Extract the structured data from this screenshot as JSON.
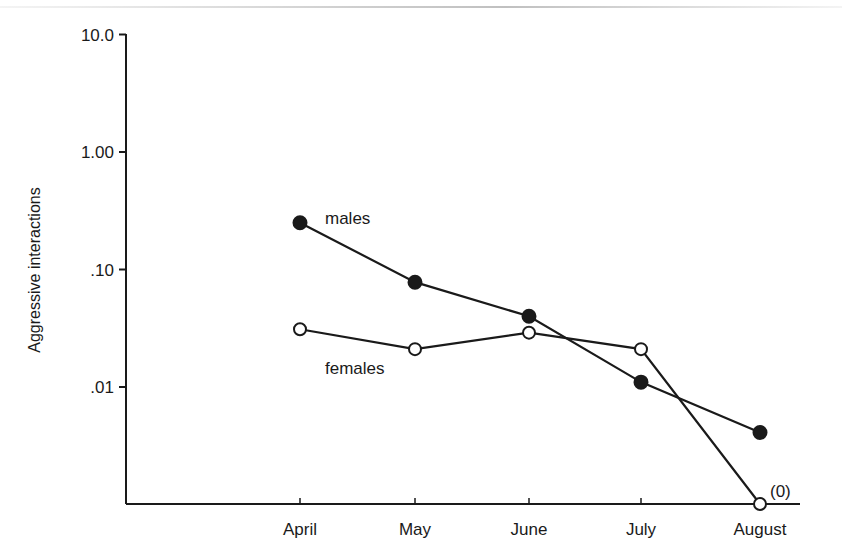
{
  "chart_data": {
    "type": "line",
    "title": "",
    "xlabel": "",
    "ylabel": "Aggressive interactions",
    "yscale": "log",
    "ylim": [
      0.001,
      10.0
    ],
    "y_ticks": [
      {
        "value": 10.0,
        "label": "10.0"
      },
      {
        "value": 1.0,
        "label": "1.00"
      },
      {
        "value": 0.1,
        "label": ".10"
      },
      {
        "value": 0.01,
        "label": ".01"
      }
    ],
    "categories": [
      "April",
      "May",
      "June",
      "July",
      "August"
    ],
    "series": [
      {
        "name": "males",
        "marker": "filled-circle",
        "values": [
          0.25,
          0.078,
          0.04,
          0.011,
          0.0041
        ]
      },
      {
        "name": "females",
        "marker": "open-circle",
        "values": [
          0.031,
          0.021,
          0.029,
          0.021,
          0
        ]
      }
    ],
    "annotations": [
      {
        "text": "(0)",
        "at": {
          "series": "females",
          "category": "August"
        }
      }
    ],
    "grid": false,
    "legend": "inline labels next to lines"
  },
  "labels": {
    "ylabel": "Aggressive interactions",
    "males": "males",
    "females": "females",
    "zero_note": "(0)"
  }
}
